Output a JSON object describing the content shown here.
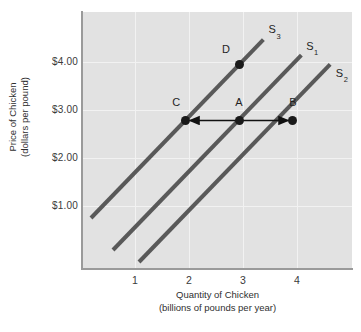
{
  "chart_data": {
    "type": "line",
    "title": "",
    "xlabel": "Quantity of Chicken",
    "xlabel_sub": "(billions of pounds per year)",
    "ylabel": "Price of Chicken",
    "ylabel_sub": "(dollars per pound)",
    "xlim": [
      0.1,
      5.1
    ],
    "ylim": [
      0.35,
      4.95
    ],
    "xticks": [
      1,
      2,
      3,
      4
    ],
    "xtick_labels": [
      "1",
      "2",
      "3",
      "4"
    ],
    "yticks": [
      1.0,
      2.0,
      3.0,
      4.0
    ],
    "ytick_labels": [
      "$1.00",
      "$2.00",
      "$3.00",
      "$4.00"
    ],
    "grid": true,
    "legend": "none",
    "curve_color": "#595959",
    "point_color": "#1a1a1a",
    "plot_background": "#e2e2e2",
    "gridline_color": "#f2f2f2",
    "axis_color": "#9a9a9a",
    "series": [
      {
        "name": "S3",
        "label": "S",
        "subscript": "3",
        "description": "decreased supply (leftmost curve)",
        "x": [
          0.25,
          3.45
        ],
        "y": [
          1.25,
          4.45
        ],
        "label_x": 3.55,
        "label_y": 4.62
      },
      {
        "name": "S1",
        "label": "S",
        "subscript": "1",
        "description": "original supply (middle curve)",
        "x": [
          0.65,
          4.15
        ],
        "y": [
          0.68,
          4.18
        ],
        "label_x": 4.25,
        "label_y": 4.33
      },
      {
        "name": "S2",
        "label": "S",
        "subscript": "2",
        "description": "increased supply (rightmost curve)",
        "x": [
          1.15,
          4.7
        ],
        "y": [
          0.45,
          4.0
        ],
        "label_x": 4.8,
        "label_y": 3.84
      }
    ],
    "points": [
      {
        "name": "C",
        "label": "C",
        "x": 2,
        "y": 3.0,
        "on_curve": "S3",
        "label_dx": -9,
        "label_dy": -7
      },
      {
        "name": "A",
        "label": "A",
        "x": 3,
        "y": 3.0,
        "on_curve": "S1",
        "label_dx": 0,
        "label_dy": -7
      },
      {
        "name": "B",
        "label": "B",
        "x": 4,
        "y": 3.0,
        "on_curve": "S2",
        "label_dx": 0,
        "label_dy": -7
      },
      {
        "name": "D",
        "label": "D",
        "x": 3,
        "y": 4.0,
        "on_curve": "S3",
        "label_dx": -13,
        "label_dy": -4
      }
    ],
    "annotations": [
      {
        "name": "arrow-a-to-c",
        "type": "arrow",
        "from": {
          "x": 3,
          "y": 3.0
        },
        "to": {
          "x": 2,
          "y": 3.0
        },
        "direction": "left",
        "meaning": "decrease in supply"
      },
      {
        "name": "arrow-a-to-b",
        "type": "arrow",
        "from": {
          "x": 3,
          "y": 3.0
        },
        "to": {
          "x": 4,
          "y": 3.0
        },
        "direction": "right",
        "meaning": "increase in supply"
      }
    ]
  }
}
